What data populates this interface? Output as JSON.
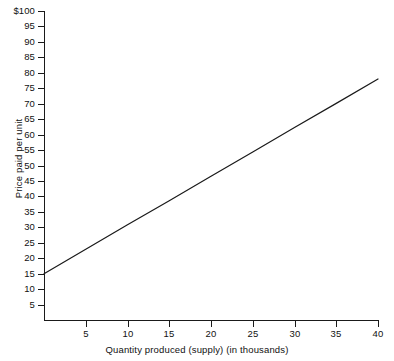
{
  "chart_data": {
    "type": "line",
    "title": "",
    "subtitle": "",
    "xlabel": "Quantity produced (supply) (in thousands)",
    "ylabel": "Price paid per unit",
    "xlim": [
      0,
      40
    ],
    "ylim": [
      0,
      100
    ],
    "grid": false,
    "legend": null,
    "legend_position": "none",
    "x_ticks": [
      5,
      10,
      15,
      20,
      25,
      30,
      35,
      40
    ],
    "x_tick_labels": [
      "5",
      "10",
      "15",
      "20",
      "25",
      "30",
      "35",
      "40"
    ],
    "y_ticks": [
      5,
      10,
      15,
      20,
      25,
      30,
      35,
      40,
      45,
      50,
      55,
      60,
      65,
      70,
      75,
      80,
      85,
      90,
      95,
      100
    ],
    "y_tick_labels": [
      "5",
      "10",
      "15",
      "20",
      "25",
      "30",
      "35",
      "40",
      "45",
      "50",
      "55",
      "60",
      "65",
      "70",
      "75",
      "80",
      "85",
      "90",
      "95",
      "$100"
    ],
    "series": [
      {
        "name": "Supply curve",
        "color": "#1a1a1a",
        "x": [
          0,
          5,
          10,
          15,
          20,
          25,
          30,
          35,
          40
        ],
        "values": [
          15.0,
          22.9,
          30.8,
          38.6,
          46.5,
          54.4,
          62.3,
          70.1,
          78.0
        ]
      }
    ],
    "annotations": []
  },
  "axis_titles": {
    "x": "Quantity produced (supply) (in thousands)",
    "y": "Price paid per unit"
  },
  "colors": {
    "background": "#ffffff",
    "axis": "#1a1a1a",
    "line": "#1a1a1a",
    "text": "#111111"
  }
}
